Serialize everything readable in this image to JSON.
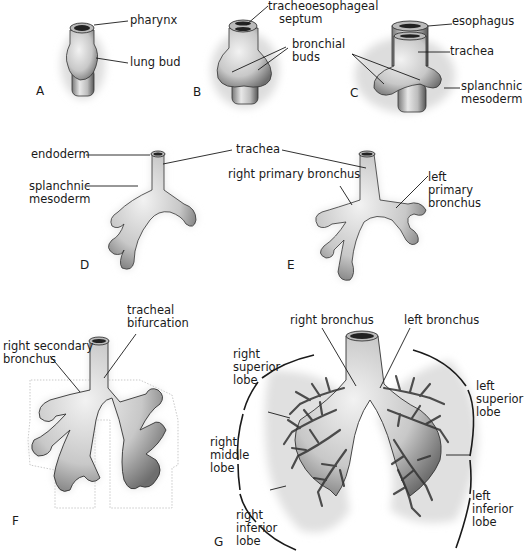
{
  "figure": {
    "panels": [
      {
        "id": "A",
        "letter": "A",
        "labels": [
          {
            "key": "pharynx",
            "text": "pharynx"
          },
          {
            "key": "lung_bud",
            "text": "lung bud"
          }
        ]
      },
      {
        "id": "B",
        "letter": "B",
        "labels": [
          {
            "key": "tracheoesophageal_septum",
            "text": "tracheoesophageal\n   septum"
          },
          {
            "key": "bronchial_buds",
            "text": "bronchial\nbuds"
          }
        ]
      },
      {
        "id": "C",
        "letter": "C",
        "labels": [
          {
            "key": "esophagus",
            "text": "esophagus"
          },
          {
            "key": "trachea",
            "text": "trachea"
          },
          {
            "key": "splanchnic_mesoderm",
            "text": "splanchnic\nmesoderm"
          }
        ]
      },
      {
        "id": "D",
        "letter": "D",
        "labels": [
          {
            "key": "endoderm",
            "text": "endoderm"
          },
          {
            "key": "splanchnic_mesoderm",
            "text": "splanchnic\nmesoderm"
          }
        ]
      },
      {
        "id": "DE_shared",
        "letter": "",
        "labels": [
          {
            "key": "trachea",
            "text": "trachea"
          }
        ]
      },
      {
        "id": "E",
        "letter": "E",
        "labels": [
          {
            "key": "right_primary_bronchus",
            "text": "right primary bronchus"
          },
          {
            "key": "left_primary_bronchus",
            "text": "left\nprimary\nbronchus"
          }
        ]
      },
      {
        "id": "F",
        "letter": "F",
        "labels": [
          {
            "key": "tracheal_bifurcation",
            "text": "tracheal\nbifurcation"
          },
          {
            "key": "right_secondary_bronchus",
            "text": "right secondary\nbronchus"
          }
        ]
      },
      {
        "id": "G",
        "letter": "G",
        "labels": [
          {
            "key": "right_bronchus",
            "text": "right  bronchus"
          },
          {
            "key": "left_bronchus",
            "text": "left  bronchus"
          },
          {
            "key": "right_superior_lobe",
            "text": "right\nsuperior\nlobe"
          },
          {
            "key": "right_middle_lobe",
            "text": "right\nmiddle\nlobe"
          },
          {
            "key": "right_inferior_lobe",
            "text": "right\ninferior\nlobe"
          },
          {
            "key": "left_superior_lobe",
            "text": "left\nsuperior\nlobe"
          },
          {
            "key": "left_inferior_lobe",
            "text": "left\ninferior\nlobe"
          }
        ]
      }
    ]
  },
  "colors": {
    "ink": "#1a1a1a",
    "tissue_fill": "#d6d6d6",
    "tissue_shade": "#8a8a8a",
    "mesoderm_halo": "#e6e6e6",
    "lumen": "#222222",
    "background": "#ffffff"
  }
}
